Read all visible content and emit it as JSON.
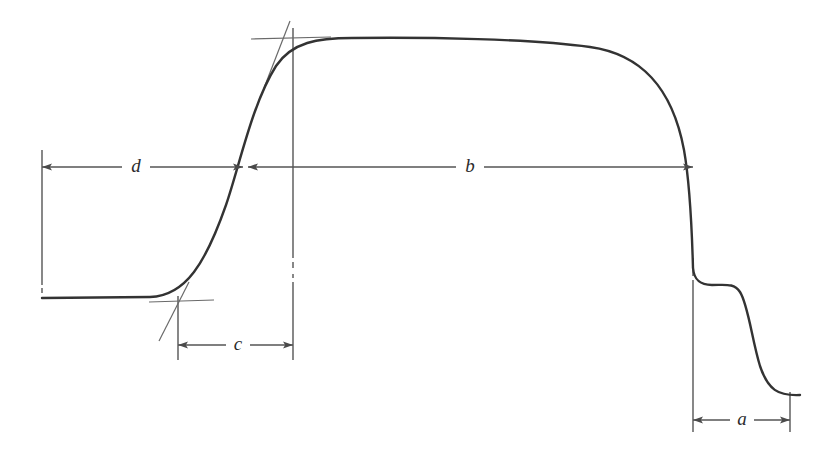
{
  "figure": {
    "background_color": "#ffffff",
    "curve_color": "#333333",
    "dimension_line_color": "#555555",
    "construction_line_color": "#666666",
    "width": 837,
    "height": 450
  },
  "dimensions": {
    "a": {
      "label": "a",
      "label_x": 742,
      "label_y": 412,
      "line_y": 420,
      "x_start": 693,
      "x_end": 790,
      "arrow_start": "left",
      "arrow_end": "right"
    },
    "b": {
      "label": "b",
      "label_x": 470,
      "label_y": 168,
      "line_y": 167,
      "x_start": 248,
      "x_end": 693,
      "arrow_start": "left",
      "arrow_end": "right"
    },
    "c": {
      "label": "c",
      "label_x": 238,
      "label_y": 346,
      "line_y": 345,
      "x_start": 178,
      "x_end": 293,
      "arrow_start": "left",
      "arrow_end": "right"
    },
    "d": {
      "label": "d",
      "label_x": 136,
      "label_y": 168,
      "line_y": 167,
      "x_start": 42,
      "x_end": 243,
      "arrow_start": "left",
      "arrow_end": "right"
    }
  },
  "extension_lines": [
    {
      "name": "left-datum",
      "x": 42,
      "y_top": 150,
      "y_bottom": 297
    },
    {
      "name": "inflection-vertical",
      "x": 293,
      "y_top": 28,
      "y_bottom": 360
    },
    {
      "name": "right-drop-datum",
      "x": 693,
      "y_top": 160,
      "y_bottom": 432
    },
    {
      "name": "lower-inflection-vertical",
      "x": 178,
      "y_top": 296,
      "y_bottom": 360
    },
    {
      "name": "final-flat-datum",
      "x": 790,
      "y_top": 392,
      "y_bottom": 432
    }
  ],
  "construction": {
    "upper_tangent": {
      "x1": 289,
      "y1": 22,
      "x2": 265,
      "y2": 86
    },
    "upper_tick": {
      "x1": 252,
      "y1": 39,
      "x2": 330,
      "y2": 37
    },
    "lower_tangent": {
      "x1": 188,
      "y1": 283,
      "x2": 160,
      "y2": 340
    },
    "lower_tick": {
      "x1": 150,
      "y1": 302,
      "x2": 213,
      "y2": 300
    }
  },
  "curve": {
    "description": "Sigmoid rise from left baseline to flat plateau, then steep drop with intermediate shoulder to final baseline",
    "baseline_left_y": 298,
    "plateau_y": 40,
    "shoulder_y": 285,
    "final_baseline_y": 395,
    "x_start": 42,
    "x_end": 800
  }
}
